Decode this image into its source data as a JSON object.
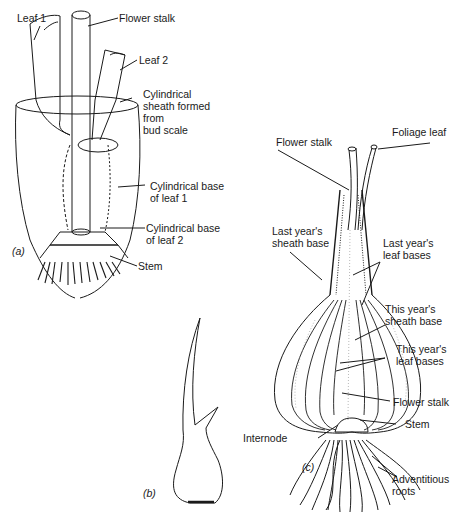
{
  "figure": {
    "panels": [
      {
        "id": "a",
        "label": "(a)",
        "annotations": [
          {
            "text": "Leaf 1"
          },
          {
            "text": "Flower stalk"
          },
          {
            "text": "Leaf 2"
          },
          {
            "text": "Cylindrical\nsheath formed\nfrom\nbud scale"
          },
          {
            "text": "Cylindrical base\nof leaf 1"
          },
          {
            "text": "Cylindrical base\nof leaf 2"
          },
          {
            "text": "Stem"
          }
        ]
      },
      {
        "id": "b",
        "label": "(b)",
        "annotations": []
      },
      {
        "id": "c",
        "label": "(c)",
        "annotations": [
          {
            "text": "Flower stalk"
          },
          {
            "text": "Foliage leaf"
          },
          {
            "text": "Last year's\nsheath base"
          },
          {
            "text": "Last year's\nleaf bases"
          },
          {
            "text": "This year's\nsheath base"
          },
          {
            "text": "This year's\nleaf bases"
          },
          {
            "text": "Flower stalk"
          },
          {
            "text": "Stem"
          },
          {
            "text": "Internode"
          },
          {
            "text": "Adventitious\nroots"
          }
        ]
      }
    ]
  }
}
